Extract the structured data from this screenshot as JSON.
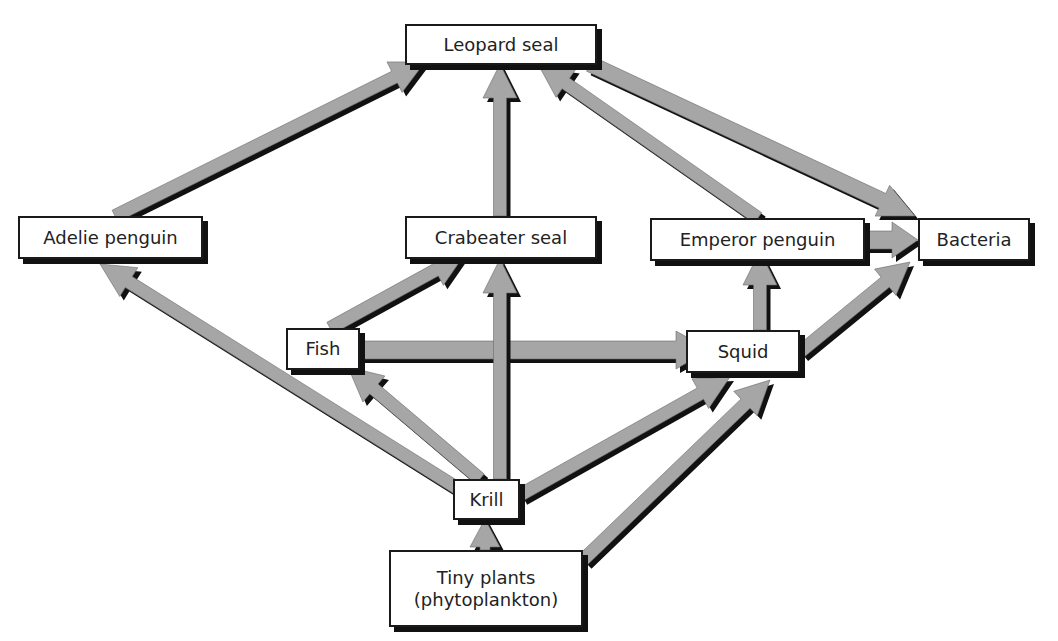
{
  "diagram": {
    "type": "food-web",
    "colors": {
      "arrow_fill": "#a6a6a6",
      "arrow_shadow": "#111111",
      "box_border": "#1a1a1a",
      "text": "#222222",
      "background": "#ffffff"
    },
    "nodes": {
      "leopard_seal": {
        "label": "Leopard seal"
      },
      "adelie_penguin": {
        "label": "Adelie penguin"
      },
      "crabeater_seal": {
        "label": "Crabeater seal"
      },
      "emperor_penguin": {
        "label": "Emperor penguin"
      },
      "bacteria": {
        "label": "Bacteria"
      },
      "fish": {
        "label": "Fish"
      },
      "squid": {
        "label": "Squid"
      },
      "krill": {
        "label": "Krill"
      },
      "tiny_plants": {
        "label_line1": "Tiny plants",
        "label_line2": "(phytoplankton)"
      }
    },
    "edges": [
      {
        "from": "Adelie penguin",
        "to": "Leopard seal"
      },
      {
        "from": "Crabeater seal",
        "to": "Leopard seal"
      },
      {
        "from": "Emperor penguin",
        "to": "Leopard seal"
      },
      {
        "from": "Leopard seal",
        "to": "Bacteria"
      },
      {
        "from": "Emperor penguin",
        "to": "Bacteria"
      },
      {
        "from": "Squid",
        "to": "Bacteria"
      },
      {
        "from": "Squid",
        "to": "Emperor penguin"
      },
      {
        "from": "Fish",
        "to": "Crabeater seal"
      },
      {
        "from": "Fish",
        "to": "Squid"
      },
      {
        "from": "Krill",
        "to": "Adelie penguin"
      },
      {
        "from": "Krill",
        "to": "Fish"
      },
      {
        "from": "Krill",
        "to": "Crabeater seal"
      },
      {
        "from": "Krill",
        "to": "Squid"
      },
      {
        "from": "Tiny plants (phytoplankton)",
        "to": "Krill"
      },
      {
        "from": "Tiny plants (phytoplankton)",
        "to": "Squid"
      }
    ]
  }
}
